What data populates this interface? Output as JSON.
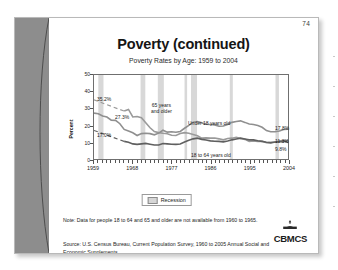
{
  "slide": {
    "page_number": "74",
    "title": "Poverty (continued)",
    "chart_title": "Poverty Rates by Age: 1959 to 2004",
    "note": "Note: Data for people 18 to 64 and 65 and older are not available from 1960 to 1965.",
    "source": "Source: U.S. Census Bureau, Current Population Survey, 1960 to 2005 Annual Social and Economic Supplements.",
    "logo_text": "CBMCS",
    "logo_mark": "dome-building-icon"
  },
  "legend": {
    "label": "Recession",
    "swatch_color": "#d6d6d6"
  },
  "chart_data": {
    "type": "line",
    "title": "Poverty Rates by Age: 1959 to 2004",
    "xlabel": "",
    "ylabel": "Percent",
    "xlim": [
      1959,
      2004
    ],
    "ylim": [
      0,
      50
    ],
    "ytick_values": [
      0,
      10,
      20,
      30,
      40,
      50
    ],
    "ytick_labels": [
      "0",
      "10",
      "20",
      "30",
      "40",
      "50"
    ],
    "xtick_values": [
      1959,
      1968,
      1977,
      1986,
      1995,
      2004
    ],
    "xtick_labels": [
      "1959",
      "1968",
      "1977",
      "1986",
      "1995",
      "2004"
    ],
    "grid": false,
    "legend_position": "below-axis-center",
    "annotations": [
      {
        "text": "35.2%",
        "series": "65 years and older",
        "x": 1959,
        "y": 35.2,
        "role": "start-value"
      },
      {
        "text": "27.3%",
        "series": "Under 18 years old",
        "x": 1959,
        "y": 27.3,
        "role": "start-value"
      },
      {
        "text": "17.0%",
        "series": "18 to 64 years old",
        "x": 1959,
        "y": 17.0,
        "role": "start-value"
      },
      {
        "text": "17.8%",
        "series": "Under 18 years old",
        "x": 2004,
        "y": 17.8,
        "role": "end-value"
      },
      {
        "text": "11.3%",
        "series": "65 years and older",
        "x": 2004,
        "y": 11.3,
        "role": "end-value"
      },
      {
        "text": "9.8%",
        "series": "18 to 64 years old",
        "x": 2004,
        "y": 9.8,
        "role": "end-value"
      },
      {
        "text": "65 years\nand older",
        "series": "65 years and older",
        "x": 1973,
        "y": 31,
        "role": "series-label"
      },
      {
        "text": "Under 18 years old",
        "series": "Under 18 years old",
        "x": 1983,
        "y": 25,
        "role": "series-label"
      },
      {
        "text": "18 to 64 years old",
        "series": "18 to 64 years old",
        "x": 1988,
        "y": 6.5,
        "role": "series-label"
      }
    ],
    "recession_bands": [
      {
        "start": 1960.0,
        "end": 1961.2
      },
      {
        "start": 1969.8,
        "end": 1970.9
      },
      {
        "start": 1973.8,
        "end": 1975.2
      },
      {
        "start": 1980.0,
        "end": 1980.6
      },
      {
        "start": 1981.5,
        "end": 1982.9
      },
      {
        "start": 1990.5,
        "end": 1991.2
      },
      {
        "start": 2001.1,
        "end": 2001.9
      }
    ],
    "x": [
      1959,
      1960,
      1961,
      1962,
      1963,
      1964,
      1965,
      1966,
      1967,
      1968,
      1969,
      1970,
      1971,
      1972,
      1973,
      1974,
      1975,
      1976,
      1977,
      1978,
      1979,
      1980,
      1981,
      1982,
      1983,
      1984,
      1985,
      1986,
      1987,
      1988,
      1989,
      1990,
      1991,
      1992,
      1993,
      1994,
      1995,
      1996,
      1997,
      1998,
      1999,
      2000,
      2001,
      2002,
      2003,
      2004
    ],
    "series": [
      {
        "name": "65 years and older",
        "color": "#9a9a9a",
        "values": [
          35.2,
          null,
          null,
          null,
          null,
          null,
          null,
          28.5,
          29.5,
          25.0,
          25.3,
          24.6,
          21.6,
          18.6,
          16.3,
          15.7,
          15.3,
          15.0,
          14.1,
          14.0,
          15.2,
          15.7,
          15.3,
          14.6,
          13.8,
          12.4,
          12.6,
          12.4,
          12.5,
          12.0,
          11.4,
          12.2,
          12.4,
          12.9,
          12.2,
          11.7,
          10.5,
          10.8,
          10.5,
          10.5,
          9.7,
          9.9,
          10.1,
          10.4,
          10.2,
          11.3
        ]
      },
      {
        "name": "Under 18 years old",
        "color": "#8f8f8f",
        "values": [
          27.3,
          26.9,
          25.6,
          25.0,
          23.1,
          23.0,
          21.0,
          17.6,
          16.6,
          15.6,
          14.0,
          15.1,
          15.3,
          15.1,
          14.4,
          15.4,
          17.1,
          16.0,
          16.2,
          15.9,
          16.4,
          18.3,
          20.0,
          21.9,
          22.3,
          21.5,
          20.7,
          20.5,
          20.3,
          19.5,
          19.6,
          20.6,
          21.8,
          22.3,
          22.7,
          21.8,
          20.8,
          20.5,
          19.9,
          18.9,
          16.9,
          16.2,
          16.3,
          16.7,
          17.6,
          17.8
        ]
      },
      {
        "name": "18 to 64 years old",
        "color": "#5f5f5f",
        "values": [
          17.0,
          null,
          null,
          null,
          null,
          null,
          null,
          10.5,
          10.0,
          9.0,
          8.7,
          9.0,
          9.3,
          8.8,
          8.3,
          8.3,
          9.2,
          9.0,
          8.8,
          8.7,
          8.9,
          10.1,
          11.1,
          12.0,
          12.4,
          11.7,
          11.3,
          10.8,
          10.6,
          10.5,
          10.2,
          10.7,
          11.4,
          11.9,
          12.4,
          11.9,
          11.4,
          11.4,
          10.9,
          10.5,
          10.0,
          9.6,
          10.1,
          10.6,
          10.8,
          9.8
        ]
      }
    ]
  }
}
